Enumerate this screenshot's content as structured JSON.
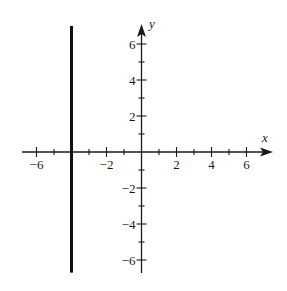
{
  "chart_data": {
    "type": "line",
    "title": "",
    "xlabel": "x",
    "ylabel": "y",
    "xlim": [
      -7,
      7
    ],
    "ylim": [
      -7,
      7
    ],
    "grid": false,
    "x_ticks_minor": [
      -6,
      -5,
      -4,
      -3,
      -2,
      -1,
      1,
      2,
      3,
      4,
      5,
      6
    ],
    "x_tick_labels": [
      {
        "value": -6,
        "label": "−6"
      },
      {
        "value": -2,
        "label": "−2"
      },
      {
        "value": 2,
        "label": "2"
      },
      {
        "value": 4,
        "label": "4"
      },
      {
        "value": 6,
        "label": "6"
      }
    ],
    "y_ticks_minor": [
      -6,
      -5,
      -4,
      -3,
      -2,
      -1,
      1,
      2,
      3,
      4,
      5,
      6
    ],
    "y_tick_labels": [
      {
        "value": 6,
        "label": "6"
      },
      {
        "value": 4,
        "label": "4"
      },
      {
        "value": 2,
        "label": "2"
      },
      {
        "value": -2,
        "label": "−2"
      },
      {
        "value": -4,
        "label": "−4"
      },
      {
        "value": -6,
        "label": "−6"
      }
    ],
    "series": [
      {
        "name": "x = -4",
        "equation": "x = -4",
        "points": [
          [
            -4,
            -6.7
          ],
          [
            -4,
            7
          ]
        ],
        "color": "#111111"
      }
    ]
  },
  "axes": {
    "x_label": "x",
    "y_label": "y"
  }
}
